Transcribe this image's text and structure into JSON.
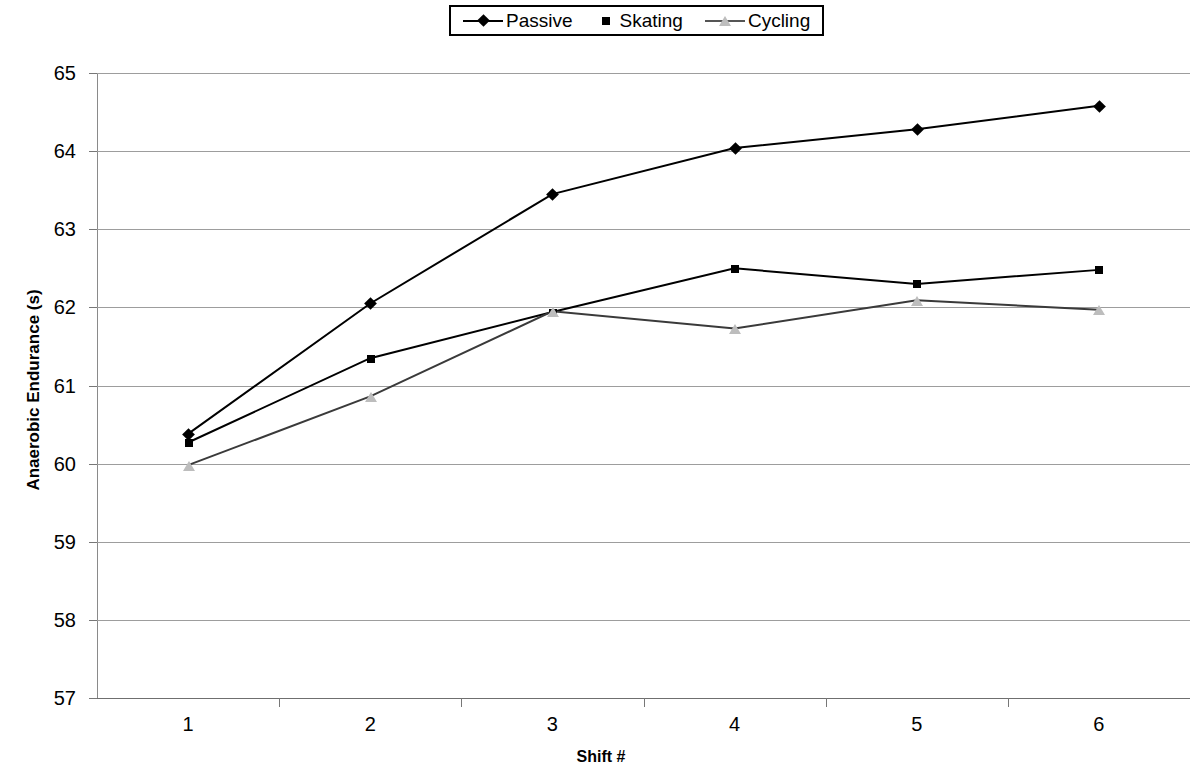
{
  "chart_data": {
    "type": "line",
    "title": "",
    "xlabel": "Shift #",
    "ylabel": "Anaerobic Endurance (s)",
    "categories": [
      "1",
      "2",
      "3",
      "4",
      "5",
      "6"
    ],
    "x": [
      1,
      2,
      3,
      4,
      5,
      6
    ],
    "ylim": [
      57,
      65
    ],
    "yticks": [
      57,
      58,
      59,
      60,
      61,
      62,
      63,
      64,
      65
    ],
    "ytick_labels": [
      "57",
      "58",
      "59",
      "60",
      "61",
      "62",
      "63",
      "64",
      "65"
    ],
    "grid": "horizontal",
    "legend_position": "top-center",
    "series": [
      {
        "name": "Passive",
        "marker": "diamond",
        "color": "#000000",
        "line": true,
        "values": [
          60.38,
          62.05,
          63.45,
          64.04,
          64.28,
          64.58
        ]
      },
      {
        "name": "Skating",
        "marker": "square",
        "color": "#000000",
        "line": true,
        "values": [
          60.27,
          61.35,
          61.94,
          62.5,
          62.3,
          62.48
        ]
      },
      {
        "name": "Cycling",
        "marker": "triangle",
        "color": "#bdbdbd",
        "line": true,
        "values": [
          59.98,
          60.86,
          61.95,
          61.73,
          62.09,
          61.97
        ]
      }
    ]
  },
  "legend": {
    "items": [
      {
        "label": "Passive",
        "marker": "diamond-marker-icon"
      },
      {
        "label": "Skating",
        "marker": "square-marker-icon"
      },
      {
        "label": "Cycling",
        "marker": "triangle-marker-icon"
      }
    ]
  },
  "axes": {
    "y_title": "Anaerobic Endurance (s)",
    "x_title": "Shift #"
  }
}
